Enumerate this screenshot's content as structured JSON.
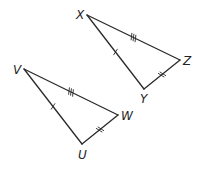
{
  "diagram": {
    "triangles": [
      {
        "name": "XYZ",
        "vertices": [
          {
            "label": "X",
            "x": 87,
            "y": 15,
            "lx": 76,
            "ly": 19
          },
          {
            "label": "Z",
            "x": 180,
            "y": 60,
            "lx": 183,
            "ly": 65
          },
          {
            "label": "Y",
            "x": 144,
            "y": 89,
            "lx": 140,
            "ly": 103
          }
        ],
        "sides": [
          {
            "from": "X",
            "to": "Y",
            "ticks": 1
          },
          {
            "from": "X",
            "to": "Z",
            "ticks": 3
          },
          {
            "from": "Y",
            "to": "Z",
            "ticks": 2
          }
        ]
      },
      {
        "name": "VUW",
        "vertices": [
          {
            "label": "V",
            "x": 24,
            "y": 69,
            "lx": 13,
            "ly": 74
          },
          {
            "label": "W",
            "x": 118,
            "y": 115,
            "lx": 121,
            "ly": 120
          },
          {
            "label": "U",
            "x": 82,
            "y": 144,
            "lx": 78,
            "ly": 159
          }
        ],
        "sides": [
          {
            "from": "V",
            "to": "U",
            "ticks": 1
          },
          {
            "from": "V",
            "to": "W",
            "ticks": 3
          },
          {
            "from": "U",
            "to": "W",
            "ticks": 2
          }
        ]
      }
    ]
  }
}
